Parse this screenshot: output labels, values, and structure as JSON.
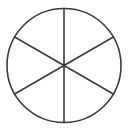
{
  "diagram": {
    "type": "circle-divided-into-sectors",
    "sectors": 6,
    "center": [
      64,
      65.5
    ],
    "radius": 57,
    "stroke_color": "#3a3a3a",
    "stroke_width": 1.6,
    "fill_color": "#ffffff",
    "spoke_angles_deg": [
      90,
      30,
      330,
      270,
      210,
      150
    ]
  }
}
